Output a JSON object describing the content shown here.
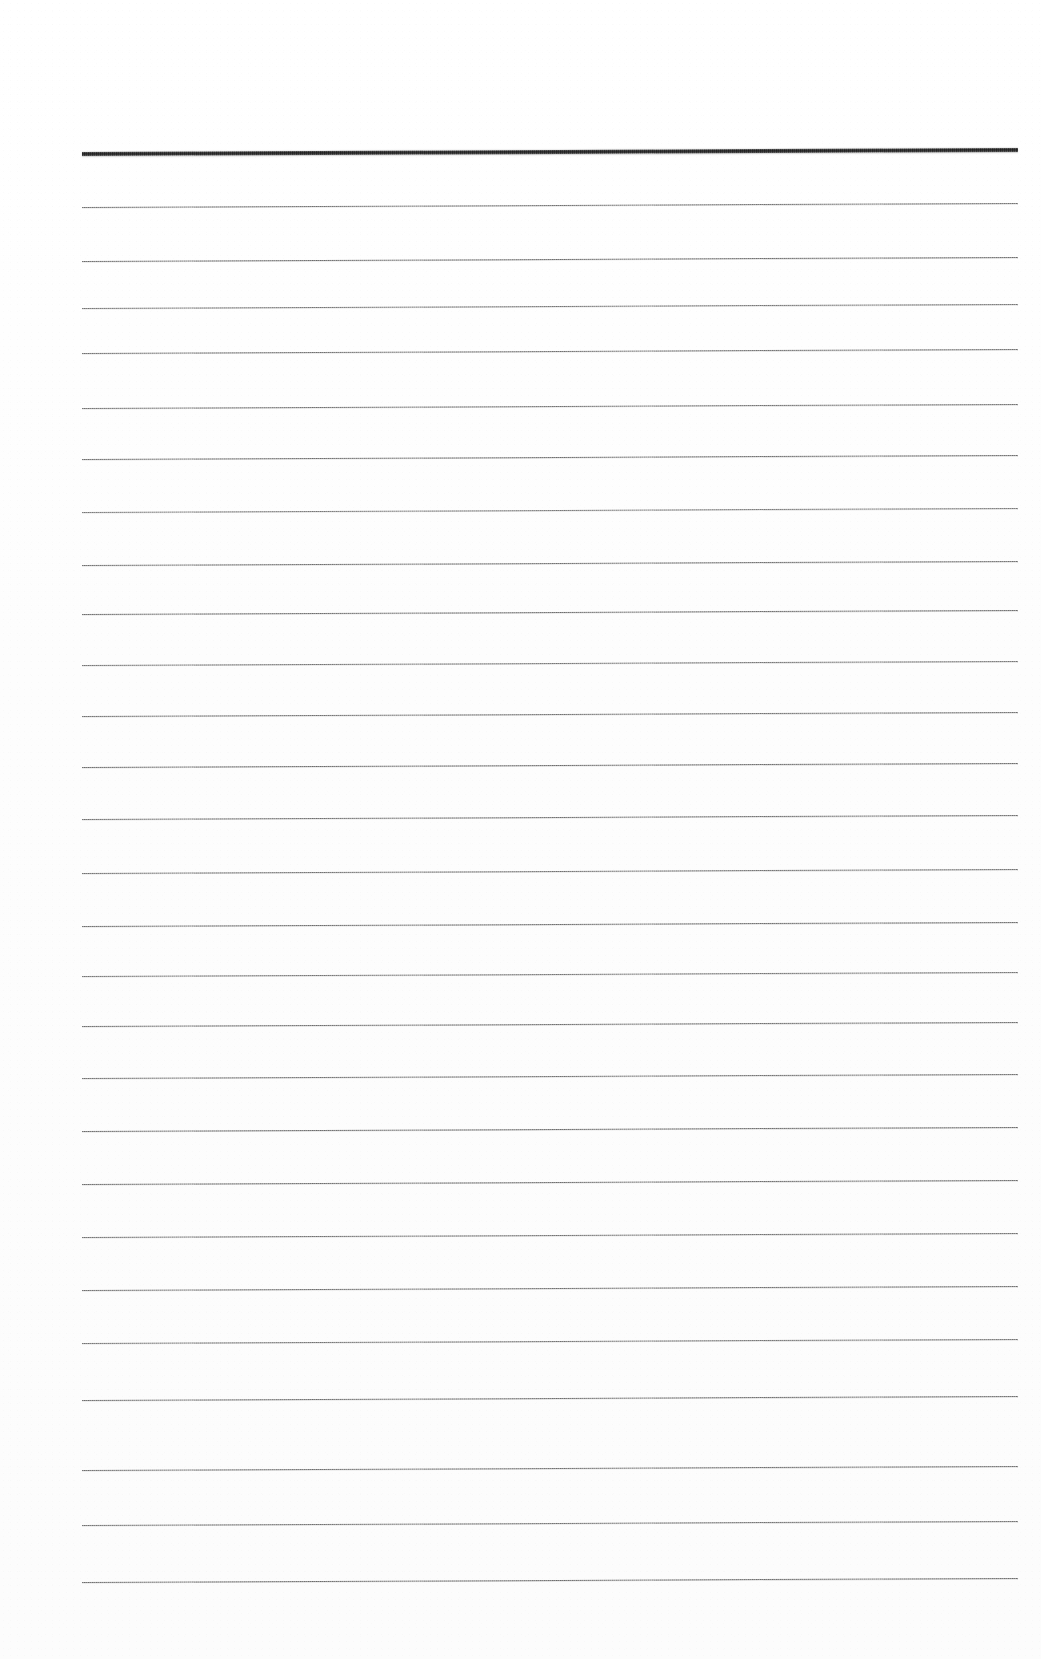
{
  "document": {
    "kind": "scanned-blank-ruled-page",
    "page_width": 1041,
    "page_height": 1659,
    "background_color": "#fefefe",
    "ink_color": "#6e6e6e",
    "header_rule_color": "#5d5d5d",
    "has_text": false,
    "visible_text": "",
    "margins": {
      "left": 80,
      "right": 21,
      "top": 152,
      "bottom": 77
    }
  },
  "ruling": {
    "line_count": 27,
    "first_line_y": 152,
    "last_line_y": 1582,
    "line_spacing": 55,
    "line_start_x": 80,
    "line_end_x": 1020,
    "line_length": 940,
    "skew_degrees": -0.25,
    "header_rule_index": 0,
    "header_rule_thickness": 4.2,
    "body_rule_thickness": 1.4,
    "lines": [
      {
        "index": 0,
        "y": 152,
        "weight": "thick",
        "x_start": 82,
        "x_end": 1018,
        "opacity": 1.0
      },
      {
        "index": 1,
        "y": 207,
        "weight": "thin",
        "x_start": 82,
        "x_end": 1018,
        "opacity": 0.92
      },
      {
        "index": 2,
        "y": 261,
        "weight": "thin",
        "x_start": 82,
        "x_end": 1018,
        "opacity": 0.95
      },
      {
        "index": 3,
        "y": 308,
        "weight": "thin",
        "x_start": 82,
        "x_end": 1018,
        "opacity": 0.9
      },
      {
        "index": 4,
        "y": 353,
        "weight": "thin",
        "x_start": 82,
        "x_end": 1018,
        "opacity": 0.93
      },
      {
        "index": 5,
        "y": 408,
        "weight": "thin",
        "x_start": 82,
        "x_end": 1018,
        "opacity": 0.92
      },
      {
        "index": 6,
        "y": 459,
        "weight": "thin",
        "x_start": 82,
        "x_end": 1018,
        "opacity": 0.94
      },
      {
        "index": 7,
        "y": 512,
        "weight": "thin",
        "x_start": 82,
        "x_end": 1018,
        "opacity": 0.88
      },
      {
        "index": 8,
        "y": 565,
        "weight": "thin",
        "x_start": 82,
        "x_end": 1018,
        "opacity": 0.93
      },
      {
        "index": 9,
        "y": 614,
        "weight": "thin",
        "x_start": 82,
        "x_end": 1018,
        "opacity": 0.94
      },
      {
        "index": 10,
        "y": 665,
        "weight": "thin",
        "x_start": 82,
        "x_end": 1018,
        "opacity": 0.9
      },
      {
        "index": 11,
        "y": 716,
        "weight": "thin",
        "x_start": 82,
        "x_end": 1018,
        "opacity": 0.92
      },
      {
        "index": 12,
        "y": 767,
        "weight": "thin",
        "x_start": 82,
        "x_end": 1018,
        "opacity": 0.95
      },
      {
        "index": 13,
        "y": 819,
        "weight": "thin",
        "x_start": 82,
        "x_end": 1018,
        "opacity": 0.93
      },
      {
        "index": 14,
        "y": 873,
        "weight": "thin",
        "x_start": 82,
        "x_end": 1018,
        "opacity": 0.92
      },
      {
        "index": 15,
        "y": 926,
        "weight": "thin",
        "x_start": 82,
        "x_end": 1018,
        "opacity": 0.94
      },
      {
        "index": 16,
        "y": 976,
        "weight": "thin",
        "x_start": 82,
        "x_end": 1018,
        "opacity": 0.9
      },
      {
        "index": 17,
        "y": 1026,
        "weight": "thin",
        "x_start": 82,
        "x_end": 1018,
        "opacity": 0.93
      },
      {
        "index": 18,
        "y": 1078,
        "weight": "thin",
        "x_start": 82,
        "x_end": 1018,
        "opacity": 0.92
      },
      {
        "index": 19,
        "y": 1131,
        "weight": "thin",
        "x_start": 82,
        "x_end": 1018,
        "opacity": 0.95
      },
      {
        "index": 20,
        "y": 1184,
        "weight": "thin",
        "x_start": 82,
        "x_end": 1018,
        "opacity": 0.94
      },
      {
        "index": 21,
        "y": 1237,
        "weight": "thin",
        "x_start": 82,
        "x_end": 1018,
        "opacity": 0.92
      },
      {
        "index": 22,
        "y": 1290,
        "weight": "thin",
        "x_start": 82,
        "x_end": 1018,
        "opacity": 0.93
      },
      {
        "index": 23,
        "y": 1343,
        "weight": "thin",
        "x_start": 82,
        "x_end": 1018,
        "opacity": 0.91
      },
      {
        "index": 24,
        "y": 1400,
        "weight": "thin",
        "x_start": 82,
        "x_end": 1018,
        "opacity": 0.94
      },
      {
        "index": 25,
        "y": 1470,
        "weight": "thin",
        "x_start": 82,
        "x_end": 1018,
        "opacity": 0.93
      },
      {
        "index": 26,
        "y": 1525,
        "weight": "thin",
        "x_start": 82,
        "x_end": 1018,
        "opacity": 0.92
      },
      {
        "index": 27,
        "y": 1582,
        "weight": "thin",
        "x_start": 82,
        "x_end": 1018,
        "opacity": 0.95
      }
    ]
  }
}
